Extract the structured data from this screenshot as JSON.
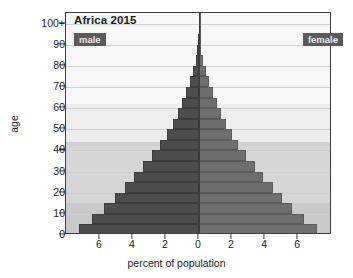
{
  "chart_data": {
    "type": "bar",
    "subtype": "population-pyramid",
    "title": "Africa 2015",
    "xlabel": "percent of population",
    "ylabel": "age",
    "xlim": [
      -8.05,
      8.05
    ],
    "ylim": [
      0,
      105
    ],
    "grid": true,
    "legend_position": "inside-top-left-and-top-right",
    "axis_note": "x axis shows absolute percent on both sides of zero",
    "xtick_values": [
      -6,
      -4,
      -2,
      0,
      2,
      4,
      6
    ],
    "xtick_labels": [
      "6",
      "4",
      "2",
      "0",
      "2",
      "4",
      "6"
    ],
    "ytick_values": [
      0,
      10,
      20,
      30,
      40,
      50,
      60,
      70,
      80,
      90,
      100
    ],
    "ytick_labels": [
      "0",
      "10",
      "20",
      "30",
      "40",
      "50",
      "60",
      "70",
      "80",
      "90",
      "100+"
    ],
    "age_groups": [
      "0-4",
      "5-9",
      "10-14",
      "15-19",
      "20-24",
      "25-29",
      "30-34",
      "35-39",
      "40-44",
      "45-49",
      "50-54",
      "55-59",
      "60-64",
      "65-69",
      "70-74",
      "75-79",
      "80-84",
      "85-89",
      "90-94",
      "95-99",
      "100+"
    ],
    "age_group_starts": [
      0,
      5,
      10,
      15,
      20,
      25,
      30,
      35,
      40,
      45,
      50,
      55,
      60,
      65,
      70,
      75,
      80,
      85,
      90,
      95,
      100
    ],
    "series": [
      {
        "name": "male",
        "color": "#4d4d4d",
        "side": "left",
        "values": [
          7.25,
          6.45,
          5.75,
          5.1,
          4.5,
          3.95,
          3.4,
          2.85,
          2.35,
          1.95,
          1.6,
          1.3,
          1.02,
          0.78,
          0.55,
          0.35,
          0.2,
          0.1,
          0.04,
          0.012,
          0.004
        ]
      },
      {
        "name": "female",
        "color": "#6f6f6f",
        "side": "right",
        "values": [
          7.15,
          6.35,
          5.65,
          5.05,
          4.45,
          3.9,
          3.38,
          2.85,
          2.38,
          2.0,
          1.66,
          1.36,
          1.08,
          0.84,
          0.6,
          0.4,
          0.24,
          0.12,
          0.05,
          0.015,
          0.005
        ]
      }
    ],
    "background_bands": [
      {
        "from": 0,
        "to": 15,
        "color": "#c9c9c9"
      },
      {
        "from": 15,
        "to": 42,
        "color": "#d6d6d6"
      },
      {
        "from": 42,
        "to": 44,
        "color": "#cfcfcf"
      },
      {
        "from": 44,
        "to": 62,
        "color": "#ededed"
      },
      {
        "from": 62,
        "to": 105,
        "color": "#f7f7f7"
      }
    ]
  },
  "legend": {
    "male_label": "male",
    "female_label": "female"
  }
}
